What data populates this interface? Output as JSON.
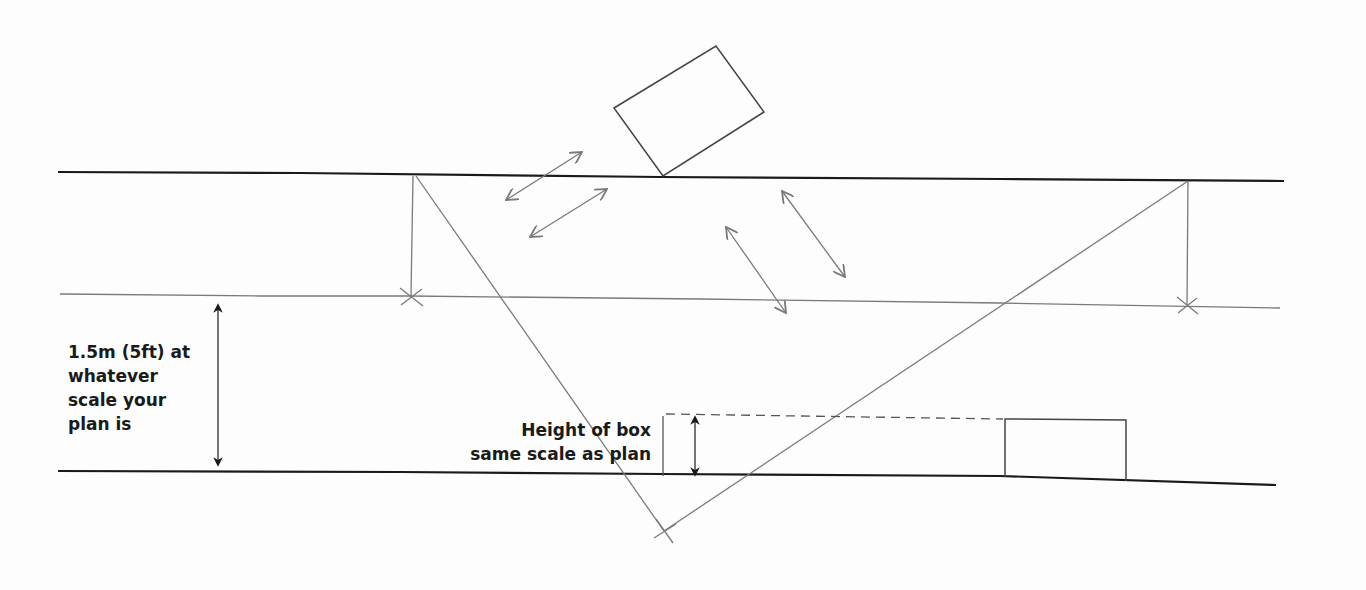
{
  "diagram": {
    "labels": {
      "eye_height": [
        "1.5m (5ft) at",
        "whatever",
        "scale your",
        "plan is"
      ],
      "box_height": [
        "Height of box",
        "same scale as plan"
      ]
    },
    "colors": {
      "heavy_line": "#1a1a1a",
      "pencil_line": "#7a7a7a",
      "background": "#fdfdfd"
    },
    "elements": [
      "top-boundary-line",
      "eye-height-line",
      "bottom-boundary-line",
      "rotated-box-plan",
      "box-elevation",
      "sight-lines",
      "double-arrows"
    ]
  }
}
